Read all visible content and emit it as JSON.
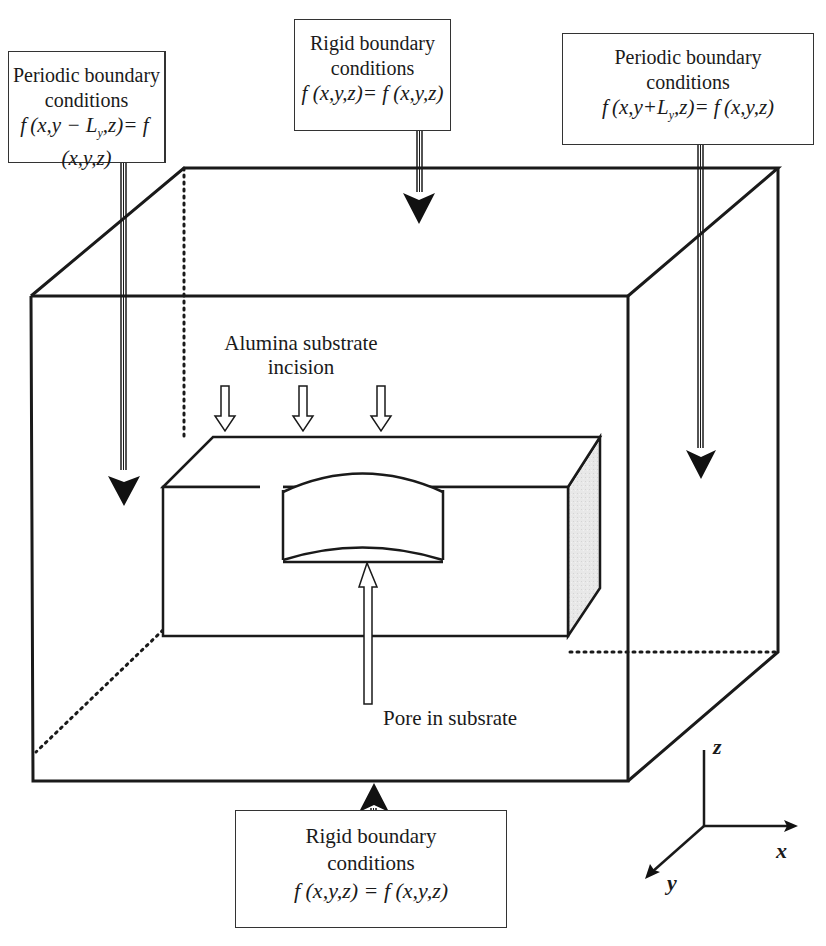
{
  "boundary_conditions": {
    "left": {
      "title_line1": "Periodic boundary",
      "title_line2": "conditions",
      "formula": "f (x,y − Ly,z)= f (x,y,z)",
      "type": "periodic"
    },
    "top": {
      "title_line1": "Rigid boundary",
      "title_line2": "conditions",
      "formula": "f (x,y,z)= f (x,y,z)",
      "type": "rigid"
    },
    "right": {
      "title_line1": "Periodic boundary",
      "title_line2": "conditions",
      "formula": "f (x,y+Ly,z)= f (x,y,z)",
      "type": "periodic"
    },
    "bottom": {
      "title_line1": "Rigid boundary",
      "title_line2": "conditions",
      "formula": "f (x,y,z) = f (x,y,z)",
      "type": "rigid"
    }
  },
  "annotations": {
    "substrate_line1": "Alumina substrate",
    "substrate_line2": "incision",
    "pore": "Pore in subsrate"
  },
  "axes": {
    "x": "x",
    "y": "y",
    "z": "z"
  },
  "colors": {
    "line": "#1a1a1a",
    "side_face": "#e6e6e6",
    "background": "#ffffff"
  }
}
